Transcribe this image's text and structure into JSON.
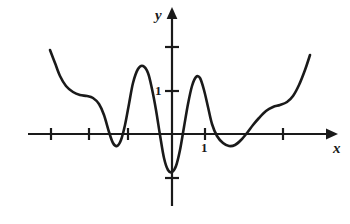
{
  "figure": {
    "kind": "cartesian-graph",
    "background_color": "#ffffff",
    "stroke_color": "#1a1a1a"
  },
  "labels": {
    "y_axis": "y",
    "x_axis": "x",
    "y_unit_tick": "1",
    "x_unit_tick": "1"
  },
  "chart_data": {
    "type": "line",
    "title": "",
    "xlabel": "x",
    "ylabel": "y",
    "grid": false,
    "legend": null,
    "axes": {
      "origin_px": [
        172,
        134
      ],
      "x_unit_px": 33,
      "y_unit_px": 43,
      "x_axis_pixel_y": 134,
      "y_axis_pixel_x": 172,
      "x_axis_arrow_end_px": 332,
      "y_axis_arrow_top_px": 12,
      "y_axis_bottom_px": 206,
      "x_axis_start_px": 28
    },
    "x_ticks_px": [
      51,
      89,
      128,
      205,
      283
    ],
    "x_tick_labels": [
      {
        "value": 1,
        "label": "1",
        "px": 205
      }
    ],
    "y_ticks_px": [
      47,
      91,
      178
    ],
    "y_tick_labels": [
      {
        "value": 1,
        "label": "1",
        "px": 91
      }
    ],
    "curve_px": [
      [
        50,
        50
      ],
      [
        55,
        63
      ],
      [
        60,
        76
      ],
      [
        66,
        86
      ],
      [
        73,
        92
      ],
      [
        80,
        95
      ],
      [
        87,
        96
      ],
      [
        93,
        98
      ],
      [
        99,
        104
      ],
      [
        104,
        115
      ],
      [
        109,
        132
      ],
      [
        113,
        143
      ],
      [
        117,
        146
      ],
      [
        121,
        140
      ],
      [
        125,
        125
      ],
      [
        129,
        104
      ],
      [
        133,
        83
      ],
      [
        138,
        69
      ],
      [
        143,
        66
      ],
      [
        148,
        73
      ],
      [
        152,
        89
      ],
      [
        156,
        110
      ],
      [
        160,
        135
      ],
      [
        164,
        158
      ],
      [
        168,
        170
      ],
      [
        172,
        172
      ],
      [
        176,
        166
      ],
      [
        180,
        150
      ],
      [
        184,
        127
      ],
      [
        188,
        104
      ],
      [
        192,
        86
      ],
      [
        196,
        77
      ],
      [
        200,
        78
      ],
      [
        204,
        90
      ],
      [
        208,
        107
      ],
      [
        212,
        124
      ],
      [
        217,
        136
      ],
      [
        223,
        143
      ],
      [
        229,
        146
      ],
      [
        235,
        145
      ],
      [
        241,
        140
      ],
      [
        247,
        133
      ],
      [
        253,
        125
      ],
      [
        259,
        118
      ],
      [
        266,
        111
      ],
      [
        273,
        107
      ],
      [
        280,
        105
      ],
      [
        287,
        102
      ],
      [
        293,
        96
      ],
      [
        299,
        85
      ],
      [
        305,
        70
      ],
      [
        310,
        55
      ]
    ],
    "features": {
      "local_maxima_px": [
        [
          141,
          66
        ],
        [
          198,
          77
        ]
      ],
      "local_minima_px": [
        [
          116,
          146
        ],
        [
          171,
          172
        ],
        [
          232,
          146
        ]
      ],
      "plateaus_px": [
        [
          84,
          96
        ],
        [
          277,
          105
        ]
      ],
      "left_branch_end_px": [
        50,
        50
      ],
      "right_branch_end_px": [
        310,
        55
      ]
    }
  }
}
